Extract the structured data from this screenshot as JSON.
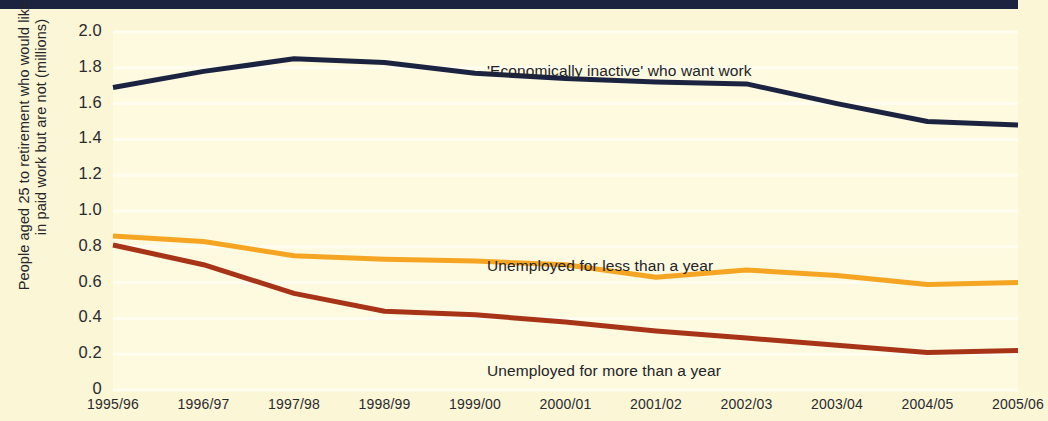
{
  "chart_data": {
    "type": "line",
    "title": "",
    "xlabel": "",
    "ylabel": "People aged 25 to retirement who would like to be in paid work but are not (millions)",
    "ylabel_line1": "People aged 25 to retirement who would like to be",
    "ylabel_line2": "in paid work but are not (millions)",
    "categories": [
      "1995/96",
      "1996/97",
      "1997/98",
      "1998/99",
      "1999/00",
      "2000/01",
      "2001/02",
      "2002/03",
      "2003/04",
      "2004/05",
      "2005/06"
    ],
    "ytick_labels": [
      "2.0",
      "1.8",
      "1.6",
      "1.4",
      "1.2",
      "1.0",
      "0.8",
      "0.6",
      "0.4",
      "0.2",
      "0"
    ],
    "ytick_values": [
      2.0,
      1.8,
      1.6,
      1.4,
      1.2,
      1.0,
      0.8,
      0.6,
      0.4,
      0.2,
      0
    ],
    "ylim": [
      0,
      2.0
    ],
    "grid": true,
    "legend_position": "inline-annotations",
    "series": [
      {
        "name": "'Economically inactive' who want work",
        "color": "#1b2340",
        "values": [
          1.69,
          1.78,
          1.85,
          1.83,
          1.77,
          1.74,
          1.72,
          1.71,
          1.6,
          1.5,
          1.48
        ]
      },
      {
        "name": "Unemployed for less than a year",
        "color": "#f5a521",
        "values": [
          0.86,
          0.83,
          0.75,
          0.73,
          0.72,
          0.7,
          0.63,
          0.67,
          0.64,
          0.59,
          0.6
        ]
      },
      {
        "name": "Unemployed for more than a year",
        "color": "#a83418",
        "values": [
          0.81,
          0.7,
          0.54,
          0.44,
          0.42,
          0.38,
          0.33,
          0.29,
          0.25,
          0.21,
          0.22
        ]
      }
    ],
    "annotations": [
      {
        "text": "'Economically inactive' who want work",
        "x_px": 487,
        "y_px": 62
      },
      {
        "text": "Unemployed for less than a year",
        "x_px": 487,
        "y_px": 257
      },
      {
        "text": "Unemployed for more than a year",
        "x_px": 487,
        "y_px": 362
      }
    ],
    "background_color": "#faf6d6",
    "plot_background_color": "#fdfadf",
    "top_bar_color": "#1b2340"
  }
}
